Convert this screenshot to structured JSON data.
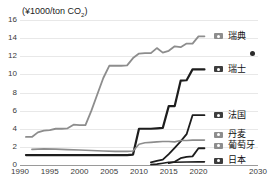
{
  "title_sliver": {
    "left_fragment": "",
    "right_fragment": ""
  },
  "axis": {
    "unit_label_pre": "(¥1000/ton CO",
    "unit_label_sub": "2",
    "unit_label_post": ")"
  },
  "chart_data": {
    "type": "line",
    "title": "",
    "xlabel": "",
    "ylabel": "¥1000/ton CO2",
    "xlim": [
      1990,
      2030
    ],
    "ylim": [
      0,
      16
    ],
    "grid": true,
    "legend_position": "right",
    "yticks": [
      "0",
      "2",
      "4",
      "6",
      "8",
      "10",
      "12",
      "14",
      "16"
    ],
    "ytick_values": [
      0,
      2,
      4,
      6,
      8,
      10,
      12,
      14,
      16
    ],
    "xticks": [
      "1990",
      "1995",
      "2000",
      "2005",
      "2010",
      "2015",
      "2020",
      "2030"
    ],
    "xtick_values": [
      1990,
      1995,
      2000,
      2005,
      2010,
      2015,
      2020,
      2030
    ],
    "annotations": [
      {
        "name": "isolated-marker",
        "x": 2029,
        "y": 12.3,
        "color": "#2b2b2b"
      }
    ],
    "series": [
      {
        "name": "瑞典",
        "color": "#8d8d8d",
        "width": 1.8,
        "end_label_y": 14.2,
        "points": [
          [
            1991,
            3.1
          ],
          [
            1992,
            3.1
          ],
          [
            1993,
            3.6
          ],
          [
            1994,
            3.8
          ],
          [
            1995,
            3.85
          ],
          [
            1996,
            4.0
          ],
          [
            1997,
            4.0
          ],
          [
            1998,
            4.05
          ],
          [
            1999,
            4.45
          ],
          [
            2000,
            4.4
          ],
          [
            2001,
            4.4
          ],
          [
            2002,
            6.0
          ],
          [
            2003,
            7.8
          ],
          [
            2004,
            9.6
          ],
          [
            2005,
            10.95
          ],
          [
            2006,
            10.95
          ],
          [
            2007,
            10.95
          ],
          [
            2008,
            11.0
          ],
          [
            2009,
            11.8
          ],
          [
            2010,
            12.3
          ],
          [
            2011,
            12.35
          ],
          [
            2012,
            12.35
          ],
          [
            2013,
            12.9
          ],
          [
            2014,
            12.4
          ],
          [
            2015,
            12.6
          ],
          [
            2016,
            13.1
          ],
          [
            2017,
            13.0
          ],
          [
            2018,
            13.4
          ],
          [
            2019,
            13.4
          ],
          [
            2020,
            14.2
          ],
          [
            2021,
            14.2
          ]
        ]
      },
      {
        "name": "瑞士",
        "color": "#1d1d1d",
        "width": 2.2,
        "end_label_y": 10.55,
        "points": [
          [
            1991,
            1.1
          ],
          [
            2008,
            1.1
          ],
          [
            2009,
            1.15
          ],
          [
            2010,
            4.0
          ],
          [
            2011,
            4.0
          ],
          [
            2012,
            4.0
          ],
          [
            2013,
            4.05
          ],
          [
            2014,
            4.1
          ],
          [
            2015,
            6.5
          ],
          [
            2016,
            6.5
          ],
          [
            2017,
            9.3
          ],
          [
            2018,
            9.35
          ],
          [
            2019,
            10.55
          ],
          [
            2020,
            10.55
          ],
          [
            2021,
            10.55
          ]
        ]
      },
      {
        "name": "法国",
        "color": "#1d1d1d",
        "width": 1.8,
        "end_label_y": 5.5,
        "points": [
          [
            2012,
            0.3
          ],
          [
            2013,
            0.45
          ],
          [
            2014,
            0.6
          ],
          [
            2015,
            1.2
          ],
          [
            2016,
            1.9
          ],
          [
            2017,
            2.6
          ],
          [
            2018,
            3.4
          ],
          [
            2019,
            5.5
          ],
          [
            2020,
            5.5
          ],
          [
            2021,
            5.5
          ]
        ]
      },
      {
        "name": "丹麦",
        "color": "#8d8d8d",
        "width": 1.6,
        "end_label_y": 2.75,
        "points": [
          [
            1992,
            1.72
          ],
          [
            1994,
            1.78
          ],
          [
            1996,
            1.75
          ],
          [
            1998,
            1.7
          ],
          [
            2000,
            1.65
          ],
          [
            2002,
            1.6
          ],
          [
            2004,
            1.55
          ],
          [
            2006,
            1.5
          ],
          [
            2008,
            1.5
          ],
          [
            2009,
            1.55
          ],
          [
            2010,
            2.3
          ],
          [
            2011,
            2.45
          ],
          [
            2012,
            2.5
          ],
          [
            2013,
            2.55
          ],
          [
            2014,
            2.6
          ],
          [
            2015,
            2.6
          ],
          [
            2016,
            2.55
          ],
          [
            2017,
            2.7
          ],
          [
            2018,
            2.7
          ],
          [
            2019,
            2.75
          ],
          [
            2020,
            2.75
          ],
          [
            2021,
            2.75
          ]
        ]
      },
      {
        "name": "葡萄牙",
        "color": "#1d1d1d",
        "width": 1.8,
        "end_label_y": 1.85,
        "points": [
          [
            2015,
            0.2
          ],
          [
            2016,
            0.35
          ],
          [
            2017,
            0.75
          ],
          [
            2018,
            0.9
          ],
          [
            2019,
            0.95
          ],
          [
            2020,
            1.85
          ],
          [
            2021,
            1.85
          ]
        ]
      },
      {
        "name": "日本",
        "color": "#1d1d1d",
        "width": 1.6,
        "end_label_y": 0.35,
        "points": [
          [
            2012,
            0.05
          ],
          [
            2013,
            0.1
          ],
          [
            2014,
            0.2
          ],
          [
            2015,
            0.3
          ],
          [
            2016,
            0.3
          ],
          [
            2018,
            0.33
          ],
          [
            2020,
            0.35
          ],
          [
            2021,
            0.35
          ]
        ]
      }
    ]
  },
  "legend": [
    {
      "label": "瑞典",
      "y": 14.2,
      "color": "#8d8d8d"
    },
    {
      "label": "瑞士",
      "y": 10.55,
      "color": "#1d1d1d"
    },
    {
      "label": "法国",
      "y": 5.5,
      "color": "#1d1d1d"
    },
    {
      "label": "丹麦",
      "y": 3.35,
      "color": "#8d8d8d"
    },
    {
      "label": "葡萄牙",
      "y": 2.1,
      "color": "#8d8d8d"
    },
    {
      "label": "日本",
      "y": 0.45,
      "color": "#1d1d1d"
    }
  ]
}
